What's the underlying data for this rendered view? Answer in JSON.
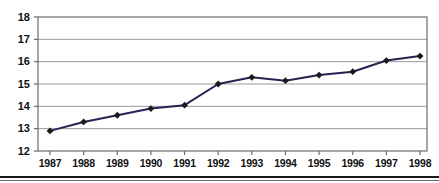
{
  "chart_data": {
    "type": "line",
    "title": "",
    "subtitle": "",
    "xlabel": "",
    "ylabel": "",
    "categories": [
      "1987",
      "1988",
      "1989",
      "1990",
      "1991",
      "1992",
      "1993",
      "1994",
      "1995",
      "1996",
      "1997",
      "1998"
    ],
    "values": [
      12.9,
      13.3,
      13.6,
      13.9,
      14.05,
      15.0,
      15.3,
      15.15,
      15.4,
      15.55,
      16.05,
      16.25
    ],
    "series": [
      {
        "name": "",
        "values": [
          12.9,
          13.3,
          13.6,
          13.9,
          14.05,
          15.0,
          15.3,
          15.15,
          15.4,
          15.55,
          16.05,
          16.25
        ],
        "line_color": "#262352",
        "marker": "diamond",
        "marker_color": "#1a1a1a"
      }
    ],
    "ylim": [
      12,
      18
    ],
    "yticks": [
      12,
      13,
      14,
      15,
      16,
      17,
      18
    ],
    "ytick_labels": [
      "12",
      "13",
      "14",
      "15",
      "16",
      "17",
      "18"
    ],
    "xtick_labels": [
      "1987",
      "1988",
      "1989",
      "1990",
      "1991",
      "1992",
      "1993",
      "1994",
      "1995",
      "1996",
      "1997",
      "1998"
    ],
    "grid": true,
    "grid_axis": "y",
    "grid_color": "#9a9a9a",
    "legend": false,
    "legend_position": "none",
    "annotations": [],
    "frame_color": "#6b6b6b",
    "background": "#ffffff"
  }
}
